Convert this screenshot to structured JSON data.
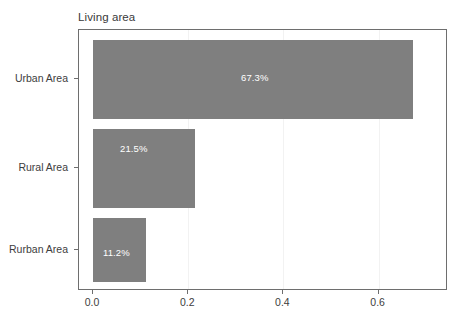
{
  "chart_data": {
    "type": "bar",
    "orientation": "horizontal",
    "title": "Living area",
    "xlabel": "",
    "ylabel": "",
    "categories": [
      "Urban Area",
      "Rural Area",
      "Rurban Area"
    ],
    "values": [
      0.673,
      0.215,
      0.112
    ],
    "data_labels": [
      "67.3%",
      "21.5%",
      "11.2%"
    ],
    "xticks": [
      "0.0",
      "0.2",
      "0.4",
      "0.6"
    ],
    "xtick_values": [
      0.0,
      0.2,
      0.4,
      0.6
    ],
    "xlim": [
      0.0,
      0.71
    ],
    "grid": true,
    "legend": "none",
    "bar_color": "#7f7f7f",
    "label_color": "#ffffff",
    "axis_color": "#6e6e6e"
  }
}
